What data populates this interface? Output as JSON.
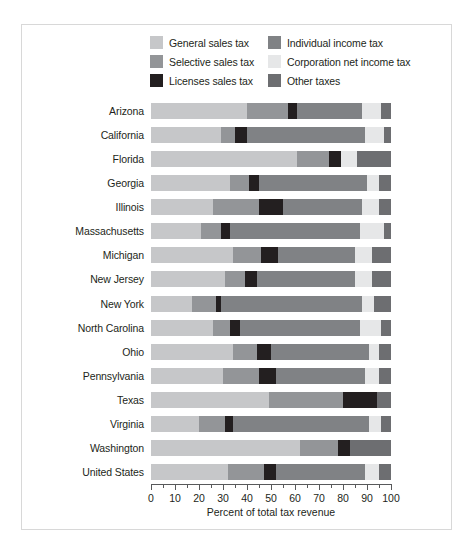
{
  "chart_data": {
    "type": "bar",
    "orientation": "horizontal",
    "stacked": true,
    "title": "",
    "xlabel": "Percent of total tax revenue",
    "ylabel": "",
    "xlim": [
      0,
      100
    ],
    "xticks": [
      0,
      10,
      20,
      30,
      40,
      50,
      60,
      70,
      80,
      90,
      100
    ],
    "xtick_labels": [
      "0",
      "10",
      "20",
      "30",
      "40",
      "50",
      "60",
      "70",
      "80",
      "90",
      "100"
    ],
    "minor_tick_step": 5,
    "grid": false,
    "legend_position": "top-center",
    "categories": [
      "Arizona",
      "California",
      "Florida",
      "Georgia",
      "Illinois",
      "Massachusetts",
      "Michigan",
      "New Jersey",
      "New York",
      "North Carolina",
      "Ohio",
      "Pennsylvania",
      "Texas",
      "Virginia",
      "Washington",
      "United States"
    ],
    "series": [
      {
        "name": "General sales tax",
        "color": "#c6c7c9",
        "values": [
          40,
          29,
          61,
          33,
          26,
          21,
          34,
          31,
          17,
          26,
          34,
          30,
          49,
          20,
          62,
          32
        ]
      },
      {
        "name": "Selective sales tax",
        "color": "#939598",
        "values": [
          17,
          6,
          13,
          8,
          19,
          8,
          12,
          8,
          10,
          7,
          10,
          15,
          31,
          11,
          16,
          15
        ]
      },
      {
        "name": "Licenses sales tax",
        "color": "#231f20",
        "values": [
          4,
          5,
          5,
          4,
          10,
          4,
          7,
          5,
          2,
          4,
          6,
          7,
          14,
          3,
          5,
          5
        ]
      },
      {
        "name": "Individual income tax",
        "color": "#808285",
        "values": [
          27,
          49,
          0,
          45,
          33,
          54,
          32,
          41,
          59,
          50,
          41,
          37,
          0,
          57,
          0,
          37
        ]
      },
      {
        "name": "Corporation net income tax",
        "color": "#e6e7e8",
        "values": [
          8,
          8,
          7,
          5,
          7,
          10,
          7,
          7,
          5,
          9,
          4,
          6,
          0,
          5,
          0,
          6
        ]
      },
      {
        "name": "Other taxes",
        "color": "#6d6e71",
        "values": [
          4,
          3,
          14,
          5,
          5,
          3,
          8,
          8,
          7,
          4,
          5,
          5,
          6,
          4,
          17,
          5
        ]
      }
    ]
  },
  "legend": {
    "items": [
      {
        "label": "General sales tax",
        "color": "#c6c7c9"
      },
      {
        "label": "Individual income tax",
        "color": "#808285"
      },
      {
        "label": "Selective sales tax",
        "color": "#939598"
      },
      {
        "label": "Corporation net income tax",
        "color": "#e6e7e8"
      },
      {
        "label": "Licenses sales tax",
        "color": "#231f20"
      },
      {
        "label": "Other taxes",
        "color": "#6d6e71"
      }
    ]
  }
}
